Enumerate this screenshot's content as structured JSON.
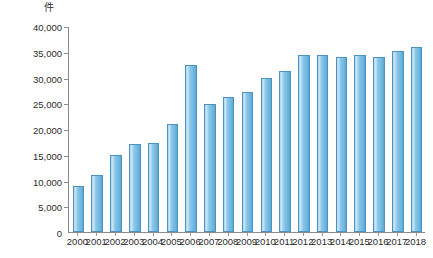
{
  "axis": {
    "unit_label": "件",
    "y_ticks": [
      "0",
      "5,000",
      "10,000",
      "15,000",
      "20,000",
      "25,000",
      "30,000",
      "35,000",
      "40,000"
    ]
  },
  "colors": {
    "bar_fill": "#8cc7e8",
    "bar_edge": "#4e93bf",
    "axis": "#8c8c8c",
    "text": "#2b2b2b",
    "background": "#ffffff"
  },
  "chart_data": {
    "type": "bar",
    "title": "",
    "xlabel": "",
    "ylabel": "件",
    "ylim": [
      0,
      40000
    ],
    "ytick_step": 5000,
    "grid": false,
    "legend": false,
    "categories": [
      "2000",
      "2001",
      "2002",
      "2003",
      "2004",
      "2005",
      "2006",
      "2007",
      "2008",
      "2009",
      "2010",
      "2011",
      "2012",
      "2013",
      "2014",
      "2015",
      "2016",
      "2017",
      "2018"
    ],
    "values": [
      9000,
      11000,
      15000,
      17000,
      17200,
      21000,
      32400,
      24800,
      26200,
      27200,
      30000,
      31300,
      34400,
      34400,
      34000,
      34400,
      34000,
      35200,
      36000
    ]
  }
}
